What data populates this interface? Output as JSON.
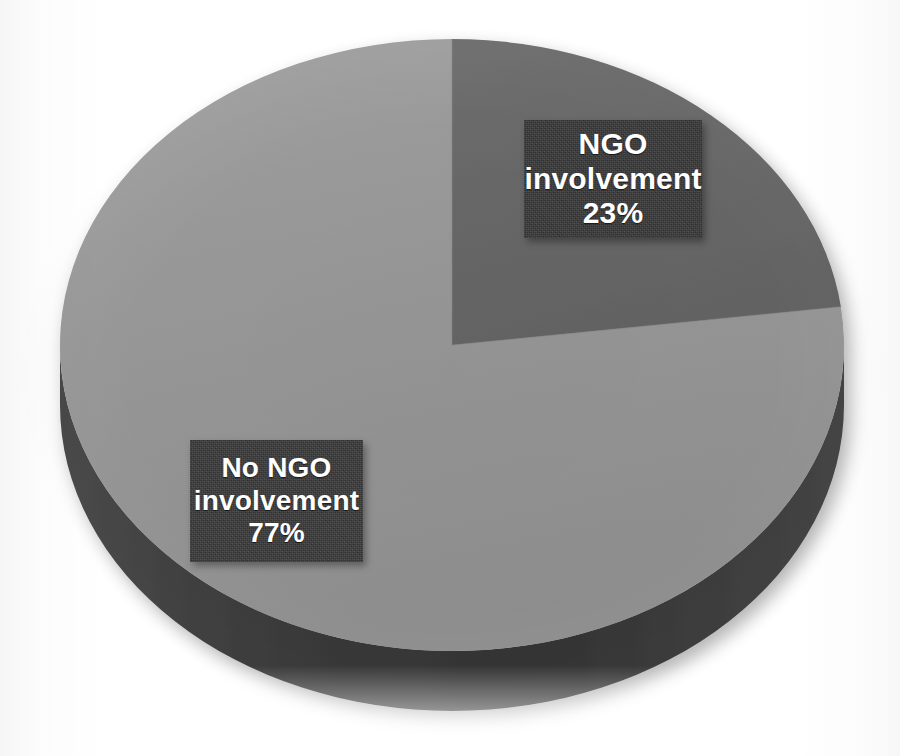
{
  "figure": {
    "background_color": "#ffffff",
    "width": 900,
    "height": 756
  },
  "chart_data": {
    "type": "pie",
    "title": "",
    "subtitle": "",
    "xlabel": "",
    "ylabel": "",
    "legend_position": "none",
    "grid": false,
    "three_d": true,
    "start_angle_deg": 0,
    "direction": "clockwise",
    "categories": [
      "NGO involvement",
      "No NGO involvement"
    ],
    "values": [
      23,
      77
    ],
    "value_unit": "%",
    "colors": [
      "#6b6b6b",
      "#9a9a9a"
    ],
    "side_wall_colors": [
      "#343434",
      "#3f3f3f"
    ],
    "labels": [
      {
        "name": "ngo-involvement",
        "line1": "NGO",
        "line2": "involvement",
        "line3": "23%",
        "value": 23,
        "slice_color": "#6b6b6b",
        "box_color": "#383838",
        "text_color": "#ffffff"
      },
      {
        "name": "no-ngo-involvement",
        "line1": "No NGO",
        "line2": "involvement",
        "line3": "77%",
        "value": 77,
        "slice_color": "#9a9a9a",
        "box_color": "#3a3a3a",
        "text_color": "#ffffff"
      }
    ]
  },
  "geometry": {
    "center_x": 452,
    "center_y": 345,
    "radius_x": 392,
    "radius_y": 306,
    "depth": 60
  }
}
